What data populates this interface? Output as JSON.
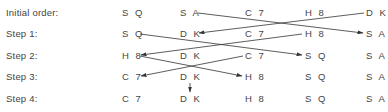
{
  "diagram": {
    "type": "sort-steps",
    "row_labels": [
      "Initial order:",
      "Step 1:",
      "Step 2:",
      "Step 3:",
      "Step 4:"
    ],
    "rows": [
      [
        "S Q",
        "S A",
        "C 7",
        "H 8",
        "D K"
      ],
      [
        "S Q",
        "D K",
        "C 7",
        "H 8",
        "S A"
      ],
      [
        "H 8",
        "D K",
        "C 7",
        "S Q",
        "S A"
      ],
      [
        "C 7",
        "D K",
        "H 8",
        "S Q",
        "S A"
      ],
      [
        "C 7",
        "D K",
        "H 8",
        "S Q",
        "S A"
      ]
    ],
    "swaps": [
      {
        "from_row": 0,
        "to_row": 1,
        "cols": [
          1,
          4
        ]
      },
      {
        "from_row": 1,
        "to_row": 2,
        "cols": [
          0,
          3
        ]
      },
      {
        "from_row": 2,
        "to_row": 3,
        "cols": [
          0,
          2
        ]
      },
      {
        "from_row": 3,
        "to_row": 4,
        "cols": [
          1,
          1
        ]
      }
    ],
    "line_color": "#333333"
  }
}
